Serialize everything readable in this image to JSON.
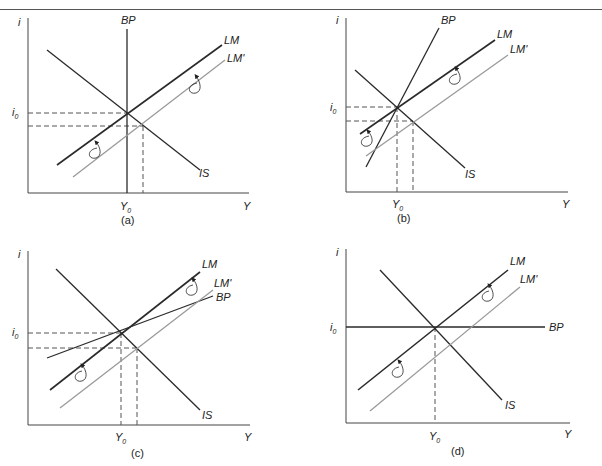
{
  "figure": {
    "panels": [
      {
        "id": "a",
        "caption": "(a)",
        "y_axis_label": "i",
        "x_axis_label": "Y",
        "i0_label": "i",
        "i0_sub": "0",
        "y0_label": "Y",
        "y0_sub": "0",
        "curves": {
          "BP": "BP",
          "LM": "LM",
          "LM_prime": "LM'",
          "IS": "IS"
        },
        "bp_slope": "vertical"
      },
      {
        "id": "b",
        "caption": "(b)",
        "y_axis_label": "i",
        "x_axis_label": "Y",
        "i0_label": "i",
        "i0_sub": "0",
        "y0_label": "Y",
        "y0_sub": "0",
        "curves": {
          "BP": "BP",
          "LM": "LM",
          "LM_prime": "LM'",
          "IS": "IS"
        },
        "bp_slope": "steeper than LM"
      },
      {
        "id": "c",
        "caption": "(c)",
        "y_axis_label": "i",
        "x_axis_label": "Y",
        "i0_label": "i",
        "i0_sub": "0",
        "y0_label": "Y",
        "y0_sub": "0",
        "curves": {
          "BP": "BP",
          "LM": "LM",
          "LM_prime": "LM'",
          "IS": "IS"
        },
        "bp_slope": "flatter than LM"
      },
      {
        "id": "d",
        "caption": "(d)",
        "y_axis_label": "i",
        "x_axis_label": "Y",
        "i0_label": "i",
        "i0_sub": "0",
        "y0_label": "Y",
        "y0_sub": "0",
        "curves": {
          "BP": "BP",
          "LM": "LM",
          "LM_prime": "LM'",
          "IS": "IS"
        },
        "bp_slope": "horizontal"
      }
    ],
    "colors": {
      "primary_line": "#2a2a2a",
      "shifted_line": "#9a9a9a",
      "dashed": "#555555",
      "axis": "#444444"
    }
  }
}
